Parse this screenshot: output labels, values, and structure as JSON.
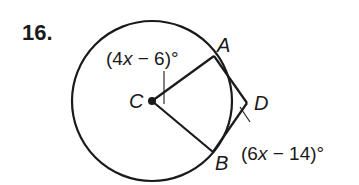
{
  "problem": {
    "number": "16."
  },
  "diagram": {
    "circle": {
      "center_label": "C",
      "cx": 152,
      "cy": 101,
      "r": 80
    },
    "points": {
      "A": {
        "label": "A",
        "x": 214,
        "y": 56
      },
      "B": {
        "label": "B",
        "x": 213,
        "y": 152
      },
      "C": {
        "label": "C",
        "x": 152,
        "y": 101
      },
      "D": {
        "label": "D",
        "x": 247,
        "y": 103
      }
    },
    "segments": [
      "CA",
      "CB",
      "AD",
      "BD"
    ],
    "angle_labels": {
      "central": {
        "prefix": "(4",
        "var": "x",
        "suffix": " − 6)°",
        "refers_to": "angle ACB"
      },
      "exterior": {
        "prefix": "(6",
        "var": "x",
        "suffix": " − 14)°",
        "refers_to": "angle ADB"
      }
    },
    "stroke_color": "#1a1a1a"
  }
}
